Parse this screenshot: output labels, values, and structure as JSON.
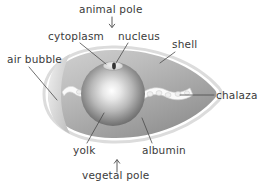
{
  "diagram": {
    "colors": {
      "text": "#3b3b3b",
      "leader_line": "#4a4a4a",
      "shell_outline": "#d8d8d8",
      "albumin_light": "#c9c9c9",
      "albumin_dark": "#8f8f8f",
      "yolk_highlight": "#ffffff",
      "yolk_mid": "#b4b4b4",
      "yolk_edge": "#5e5e5e",
      "chalaza": "#fbfbfb",
      "nucleus": "#3a3a3a",
      "background": "#ffffff"
    },
    "labels": [
      {
        "id": "animal-pole",
        "text": "animal pole",
        "pointer": "arrow-down"
      },
      {
        "id": "cytoplasm",
        "text": "cytoplasm",
        "pointer": "leader-line"
      },
      {
        "id": "nucleus",
        "text": "nucleus",
        "pointer": "leader-line"
      },
      {
        "id": "shell",
        "text": "shell",
        "pointer": "leader-line"
      },
      {
        "id": "air-bubble",
        "text": "air bubble",
        "pointer": "leader-line"
      },
      {
        "id": "chalaza",
        "text": "chalaza",
        "pointer": "leader-line"
      },
      {
        "id": "yolk",
        "text": "yolk",
        "pointer": "leader-line"
      },
      {
        "id": "albumin",
        "text": "albumin",
        "pointer": "leader-line"
      },
      {
        "id": "vegetal-pole",
        "text": "vegetal pole",
        "pointer": "arrow-up"
      }
    ],
    "parts": [
      {
        "id": "shell",
        "description": "outer pointed-oval shell outline, blunt end left, tapered point right"
      },
      {
        "id": "albumin",
        "description": "gray egg white filling the shell, shaded light at top-left to dark at lower-right"
      },
      {
        "id": "yolk",
        "description": "large central sphere with bright radial highlight"
      },
      {
        "id": "cytoplasm",
        "description": "small pale lens-shaped disc on top of the yolk"
      },
      {
        "id": "nucleus",
        "description": "dark oval dot inside the cytoplasm disc at the animal pole"
      },
      {
        "id": "chalaza-left",
        "description": "short white twisted cord left of the yolk"
      },
      {
        "id": "chalaza-right",
        "description": "long white twisted cord right of the yolk"
      },
      {
        "id": "air-bubble",
        "description": "pale notch at the blunt left end of the egg"
      }
    ]
  }
}
